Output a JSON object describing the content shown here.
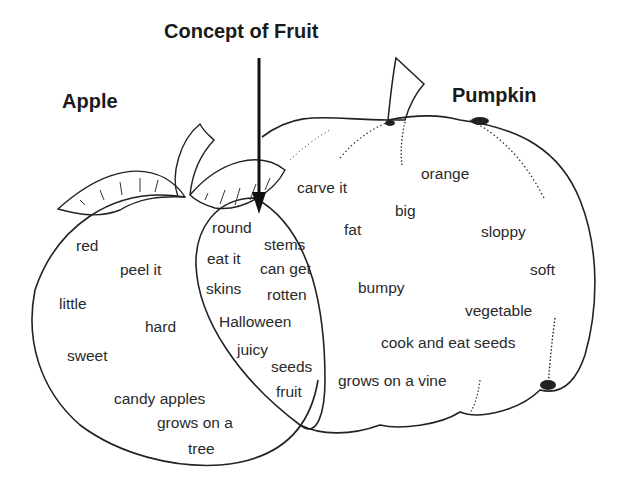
{
  "titles": {
    "concept": "Concept of Fruit",
    "apple": "Apple",
    "pumpkin": "Pumpkin"
  },
  "apple_only": [
    "red",
    "peel it",
    "little",
    "hard",
    "sweet",
    "candy apples",
    "grows on a",
    "tree"
  ],
  "shared": [
    "round",
    "stems",
    "eat it",
    "can get",
    "skins",
    "rotten",
    "Halloween",
    "juicy",
    "seeds",
    "fruit"
  ],
  "pumpkin_only": [
    "orange",
    "carve it",
    "big",
    "fat",
    "sloppy",
    "soft",
    "bumpy",
    "vegetable",
    "cook and eat seeds",
    "grows on a vine"
  ]
}
